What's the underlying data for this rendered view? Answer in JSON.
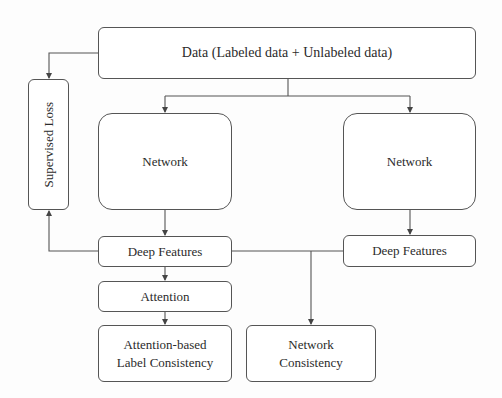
{
  "diagram": {
    "type": "flowchart",
    "nodes": {
      "data": {
        "label": "Data (Labeled data + Unlabeled data)"
      },
      "supervised_loss": {
        "label": "Supervised Loss"
      },
      "network_left": {
        "label": "Network"
      },
      "network_right": {
        "label": "Network"
      },
      "deep_features_left": {
        "label": "Deep Features"
      },
      "deep_features_right": {
        "label": "Deep Features"
      },
      "attention": {
        "label": "Attention"
      },
      "attention_label_consistency": {
        "line1": "Attention-based",
        "line2": "Label Consistency"
      },
      "network_consistency": {
        "line1": "Network",
        "line2": "Consistency"
      }
    },
    "edges": [
      {
        "from": "data",
        "to": "network_left"
      },
      {
        "from": "data",
        "to": "network_right"
      },
      {
        "from": "data",
        "to": "supervised_loss"
      },
      {
        "from": "deep_features_left",
        "to": "supervised_loss"
      },
      {
        "from": "network_left",
        "to": "deep_features_left"
      },
      {
        "from": "network_right",
        "to": "deep_features_right"
      },
      {
        "from": "deep_features_left",
        "to": "attention"
      },
      {
        "from": "attention",
        "to": "attention_label_consistency"
      },
      {
        "from": "deep_features_left",
        "to": "network_consistency"
      },
      {
        "from": "deep_features_right",
        "to": "network_consistency"
      }
    ],
    "colors": {
      "stroke": "#555555",
      "text": "#2b2b2b",
      "background": "#fdfdfd"
    }
  }
}
